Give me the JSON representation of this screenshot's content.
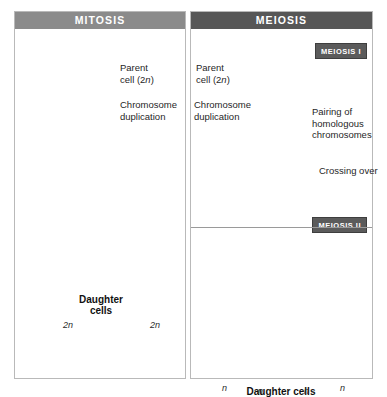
{
  "figure": {
    "clipped_caption_above": "",
    "panels": [
      {
        "id": "mitosis",
        "header": "MITOSIS",
        "header_color": "#8b8b8b",
        "labels": {
          "parent_cell": "Parent",
          "parent_cell_2": "cell (2",
          "parent_cell_n": "n",
          "parent_cell_3": ")",
          "chromosome_duplication_1": "Chromosome",
          "chromosome_duplication_2": "duplication",
          "daughter_1": "Daughter",
          "daughter_2": "cells",
          "ploidy_left": "2n",
          "ploidy_right": "2n"
        }
      },
      {
        "id": "meiosis",
        "header": "MEIOSIS",
        "header_color": "#575757",
        "badges": {
          "meiosis_one": "MEIOSIS I",
          "meiosis_two": "MEIOSIS II"
        },
        "labels": {
          "parent_cell": "Parent",
          "parent_cell_2": "cell (2",
          "parent_cell_n": "n",
          "parent_cell_3": ")",
          "chromosome_duplication_1": "Chromosome",
          "chromosome_duplication_2": "duplication",
          "pairing_1": "Pairing of",
          "pairing_2": "homologous",
          "pairing_3": "chromosomes",
          "crossing_over": "Crossing over",
          "daughter": "Daughter cells",
          "ploidy_1": "n",
          "ploidy_2": "n",
          "ploidy_3": "n",
          "ploidy_4": "n"
        }
      }
    ],
    "colors": {
      "cell_fill_light": "#f4f4f4",
      "cell_fill_edge": "#c9c9c9",
      "chromosome_dark": "#4d4d4d",
      "chromosome_light": "#9d9d9d",
      "arrow": "#1a1a1a",
      "border": "#b9b9b9",
      "text": "#1f1f1f"
    }
  }
}
